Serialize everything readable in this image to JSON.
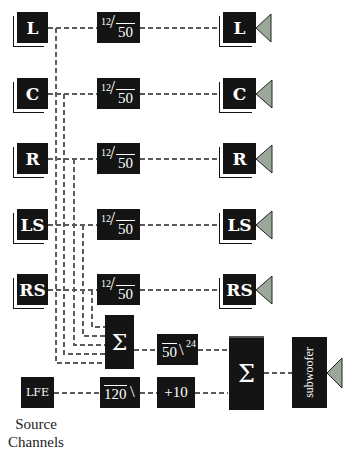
{
  "diagram": {
    "source_channels": [
      {
        "id": "L",
        "label": "L"
      },
      {
        "id": "C",
        "label": "C"
      },
      {
        "id": "R",
        "label": "R"
      },
      {
        "id": "LS",
        "label": "LS"
      },
      {
        "id": "RS",
        "label": "RS"
      },
      {
        "id": "LFE",
        "label": "LFE"
      }
    ],
    "highpass_filters": [
      {
        "sup": "12",
        "value": "50"
      },
      {
        "sup": "12",
        "value": "50"
      },
      {
        "sup": "12",
        "value": "50"
      },
      {
        "sup": "12",
        "value": "50"
      },
      {
        "sup": "12",
        "value": "50"
      }
    ],
    "outputs": [
      {
        "label": "L"
      },
      {
        "label": "C"
      },
      {
        "label": "R"
      },
      {
        "label": "LS"
      },
      {
        "label": "RS"
      }
    ],
    "sum_block": {
      "label": "Σ"
    },
    "lowpass_bass": {
      "value": "50",
      "sup": "24"
    },
    "lfe_filter": {
      "value": "120"
    },
    "lfe_gain": {
      "label": "+10"
    },
    "final_sum": {
      "label": "Σ"
    },
    "subwoofer": {
      "label": "subwoofer"
    },
    "caption": {
      "line1": "Source",
      "line2": "Channels"
    },
    "colors": {
      "block": "#141414",
      "speaker": "#9aa89a",
      "line": "#555555"
    }
  }
}
